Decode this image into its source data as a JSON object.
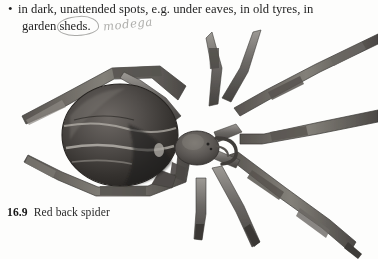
{
  "page": {
    "background_color": "#fdfdfc",
    "width": 378,
    "height": 259
  },
  "body_text": {
    "bullet_glyph": "•",
    "line_1": "in dark, unattended spots, e.g. under eaves, in old tyres, in",
    "line_2": "garden sheds.",
    "text_color": "#242424"
  },
  "annotations": {
    "handwritten_note": "modega",
    "handwriting_color": "#a9a9a6",
    "circled_word": "sheds",
    "circle_color": "#9a9a98"
  },
  "figure": {
    "caption_number": "16.9",
    "caption_text": "Red back spider",
    "palette": {
      "abdomen_dark": "#2e2c2b",
      "abdomen_mid": "#4a4746",
      "abdomen_light": "#8d8a86",
      "highlight": "#c9c5bf",
      "leg_dark": "#494745",
      "leg_mid": "#6e6b68",
      "leg_light": "#a3a09b",
      "cephalothorax": "#55514e",
      "outline": "#3a3836"
    }
  },
  "icons": {
    "bullet": "bullet-point-icon"
  }
}
